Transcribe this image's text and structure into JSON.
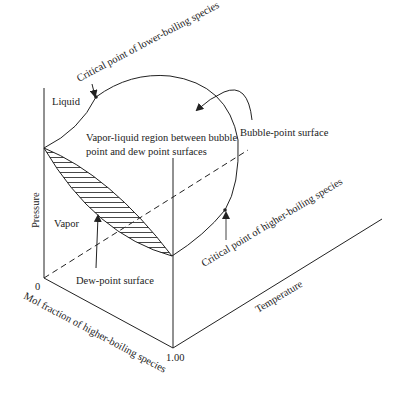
{
  "diagram": {
    "axes": {
      "pressure": "Pressure",
      "temperature": "Temperature",
      "composition": "Mol fraction of higher-boiling species",
      "composition_start": "0",
      "composition_end": "1.00"
    },
    "regions": {
      "liquid": "Liquid",
      "vapor": "Vapor",
      "two_phase": [
        "Vapor-liquid region between bubble",
        "point and dew point surfaces"
      ]
    },
    "annotations": {
      "critical_lower": "Critical point of lower-boiling species",
      "critical_higher": "Critical point of higher-boiling species",
      "bubble_surface": "Bubble-point surface",
      "dew_surface": "Dew-point surface"
    },
    "colors": {
      "line": "#222222",
      "hatch": "#333333",
      "background": "#ffffff"
    }
  }
}
